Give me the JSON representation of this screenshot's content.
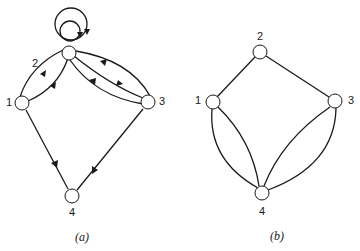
{
  "diagram_a": {
    "caption": "(a)",
    "type": "directed multigraph",
    "nodes": [
      {
        "id": "1",
        "label": "1"
      },
      {
        "id": "2",
        "label": "2"
      },
      {
        "id": "3",
        "label": "3"
      },
      {
        "id": "4",
        "label": "4"
      }
    ],
    "edges": [
      {
        "from": "2",
        "to": "2",
        "kind": "self-loop",
        "count": 2
      },
      {
        "from": "1",
        "to": "2",
        "count": 2
      },
      {
        "from": "3",
        "to": "2",
        "count": 2
      },
      {
        "from": "2",
        "to": "3",
        "count": 1
      },
      {
        "from": "1",
        "to": "4",
        "count": 1
      },
      {
        "from": "3",
        "to": "4",
        "count": 1
      }
    ]
  },
  "diagram_b": {
    "caption": "(b)",
    "type": "undirected multigraph",
    "nodes": [
      {
        "id": "1",
        "label": "1"
      },
      {
        "id": "2",
        "label": "2"
      },
      {
        "id": "3",
        "label": "3"
      },
      {
        "id": "4",
        "label": "4"
      }
    ],
    "edges": [
      {
        "from": "1",
        "to": "2",
        "count": 1
      },
      {
        "from": "2",
        "to": "3",
        "count": 1
      },
      {
        "from": "1",
        "to": "4",
        "count": 2
      },
      {
        "from": "3",
        "to": "4",
        "count": 2
      }
    ]
  }
}
